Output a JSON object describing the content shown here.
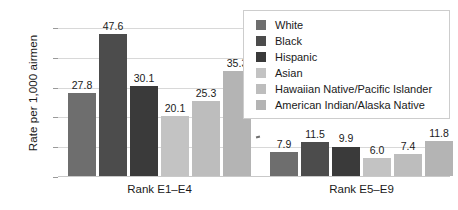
{
  "chart_data": {
    "type": "bar",
    "title": "",
    "subtitle": "",
    "xlabel": "",
    "ylabel": "Rate per 1,000 airmen",
    "ylim": [
      0,
      52
    ],
    "yticks": [
      0,
      10,
      20,
      30,
      40,
      50
    ],
    "ytick_labels": [
      "0",
      "10",
      "20",
      "30",
      "40",
      "50"
    ],
    "grid": true,
    "legend_position": "upper-right",
    "categories": [
      "Rank E1–E4",
      "Rank E5–E9"
    ],
    "series": [
      {
        "name": "White",
        "values": [
          27.8,
          7.9
        ],
        "color": "#6e6e6e"
      },
      {
        "name": "Black",
        "values": [
          47.6,
          11.5
        ],
        "color": "#4c4c4c"
      },
      {
        "name": "Hispanic",
        "values": [
          30.1,
          9.9
        ],
        "color": "#3a3a3a"
      },
      {
        "name": "Asian",
        "values": [
          20.1,
          6.0
        ],
        "color": "#c3c3c3"
      },
      {
        "name": "Hawaiian Native/Pacific Islander",
        "values": [
          25.3,
          7.4
        ],
        "color": "#bdbdbd"
      },
      {
        "name": "American Indian/Alaska Native",
        "values": [
          35.3,
          11.8
        ],
        "color": "#b4b4b4"
      }
    ],
    "value_labels": {
      "Rank E1–E4": [
        "27.8",
        "47.6",
        "30.1",
        "20.1",
        "25.3",
        "35.3"
      ],
      "Rank E5–E9": [
        "7.9",
        "11.5",
        "9.9",
        "6.0",
        "7.4",
        "11.8"
      ]
    }
  },
  "legend": {
    "items": [
      {
        "label": "White"
      },
      {
        "label": "Black"
      },
      {
        "label": "Hispanic"
      },
      {
        "label": "Asian"
      },
      {
        "label": "Hawaiian Native/Pacific Islander"
      },
      {
        "label": "American Indian/Alaska Native"
      }
    ]
  }
}
